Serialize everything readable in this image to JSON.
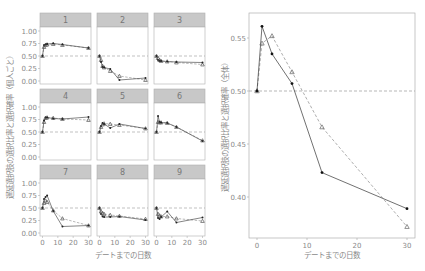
{
  "chart_data": [
    {
      "type": "line",
      "layout": "facet-grid-3x3",
      "title": "",
      "xlabel": "デートまでの日数",
      "ylabel": "遅延選択肢の選択比率と選択確率（個人ごと）",
      "xlim": [
        0,
        30
      ],
      "ylim": [
        0,
        1
      ],
      "xticks": [
        "0",
        "10",
        "20",
        "30"
      ],
      "yticks": [
        "0.00",
        "0.25",
        "0.50",
        "0.75",
        "1.00"
      ],
      "reference_line": 0.5,
      "grid": false,
      "x": [
        0,
        1,
        2,
        3,
        7,
        13,
        30
      ],
      "panels": [
        {
          "label": "1",
          "observed": [
            0.5,
            0.72,
            0.73,
            0.74,
            0.75,
            0.73,
            0.66
          ],
          "predicted": [
            0.5,
            0.68,
            0.72,
            0.73,
            0.74,
            0.72,
            0.66
          ]
        },
        {
          "label": "2",
          "observed": [
            0.5,
            0.38,
            0.28,
            0.27,
            0.24,
            0.02,
            0.06
          ],
          "predicted": [
            0.5,
            0.42,
            0.3,
            0.27,
            0.2,
            0.1,
            0.02
          ]
        },
        {
          "label": "3",
          "observed": [
            0.5,
            0.42,
            0.4,
            0.4,
            0.39,
            0.38,
            0.37
          ],
          "predicted": [
            0.5,
            0.46,
            0.42,
            0.4,
            0.39,
            0.37,
            0.33
          ]
        },
        {
          "label": "4",
          "observed": [
            0.5,
            0.73,
            0.79,
            0.79,
            0.77,
            0.76,
            0.8
          ],
          "predicted": [
            0.5,
            0.7,
            0.78,
            0.79,
            0.78,
            0.76,
            0.74
          ]
        },
        {
          "label": "5",
          "observed": [
            0.5,
            0.62,
            0.68,
            0.66,
            0.58,
            0.66,
            0.57
          ],
          "predicted": [
            0.5,
            0.6,
            0.65,
            0.67,
            0.66,
            0.64,
            0.57
          ]
        },
        {
          "label": "6",
          "observed": [
            0.5,
            0.82,
            0.7,
            0.69,
            0.68,
            0.6,
            0.32
          ],
          "predicted": [
            0.5,
            0.7,
            0.69,
            0.69,
            0.68,
            0.6,
            0.33
          ]
        },
        {
          "label": "7",
          "observed": [
            0.5,
            0.68,
            0.72,
            0.75,
            0.44,
            0.13,
            0.15
          ],
          "predicted": [
            0.5,
            0.6,
            0.65,
            0.62,
            0.45,
            0.29,
            0.15
          ]
        },
        {
          "label": "8",
          "observed": [
            0.5,
            0.38,
            0.33,
            0.32,
            0.32,
            0.33,
            0.26
          ],
          "predicted": [
            0.5,
            0.43,
            0.4,
            0.38,
            0.36,
            0.34,
            0.28
          ]
        },
        {
          "label": "9",
          "observed": [
            0.5,
            0.3,
            0.28,
            0.32,
            0.43,
            0.21,
            0.31
          ],
          "predicted": [
            0.5,
            0.38,
            0.35,
            0.33,
            0.33,
            0.29,
            0.24
          ]
        }
      ]
    },
    {
      "type": "line",
      "title": "",
      "xlabel": "デートまでの日数",
      "ylabel": "遅延選択肢の選択比率と選択確率（全体）",
      "xlim": [
        -1.5,
        31
      ],
      "ylim": [
        0.365,
        0.565
      ],
      "xticks": [
        "0",
        "10",
        "20",
        "30"
      ],
      "yticks": [
        "0.40",
        "0.45",
        "0.50",
        "0.55"
      ],
      "reference_line": 0.5,
      "grid": false,
      "x": [
        0,
        1,
        3,
        7,
        13,
        30
      ],
      "series": [
        {
          "name": "observed",
          "style": "solid-dot",
          "values": [
            0.5,
            0.561,
            0.535,
            0.507,
            0.423,
            0.389
          ]
        },
        {
          "name": "predicted",
          "style": "dashed-triangle",
          "values": [
            0.5,
            0.545,
            0.552,
            0.518,
            0.466,
            0.372
          ]
        }
      ]
    }
  ],
  "labels": {
    "xlabel": "デートまでの日数",
    "left_ylabel": "遅延選択肢の選択比率と選択確率（個人ごと）",
    "right_ylabel": "遅延選択肢の選択比率と選択確率（全体）"
  },
  "colors": {
    "strip_fill": "#c8c8c8",
    "panel_border": "#b0b0b0",
    "line": "#333333",
    "pred_line": "#999999",
    "ref_line": "#999999",
    "text": "#8a8a8a"
  }
}
